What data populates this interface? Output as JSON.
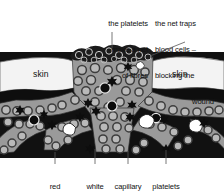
{
  "diagram": {
    "annotations": {
      "top_left": {
        "name": "platelet-net-annotation",
        "lines": [
          "the platelets",
          "make a net",
          "of fibres"
        ],
        "align": "right"
      },
      "top_right": {
        "name": "net-traps-annotation",
        "lines": [
          "the net traps",
          "blood cells –",
          "blocking the",
          "wound"
        ],
        "align": "left"
      }
    },
    "inline_labels": [
      {
        "name": "skin-label-left",
        "text": "skin"
      },
      {
        "name": "skin-label-right",
        "text": "skin"
      }
    ],
    "bottom_labels": [
      {
        "name": "red-blood-cell-label",
        "lines": [
          "red",
          "blood",
          "cell"
        ]
      },
      {
        "name": "white-blood-cell-label",
        "lines": [
          "white",
          "blood",
          "cell"
        ]
      },
      {
        "name": "capillary-label",
        "lines": [
          "capillary"
        ]
      },
      {
        "name": "platelets-label",
        "lines": [
          "platelets"
        ]
      }
    ],
    "colors": {
      "background": "#ffffff",
      "skin": "#f3f3f3",
      "tissue": "#111111",
      "vessel": "#9a9a9a",
      "cell_ring": "#4d4d4d",
      "cell_fill": "#b9b9b9",
      "clot_mesh": "#1b1b1b",
      "white_cell": "#ffffff",
      "platelet": "#0d0d0d",
      "text": "#111111",
      "leader": "#555555"
    }
  }
}
